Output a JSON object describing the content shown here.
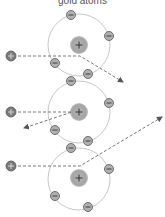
{
  "title": "gold atoms",
  "colors": {
    "orbit": "#c8c8c8",
    "nucleus": "#a9a9a9",
    "electron_fill": "#b0b0b0",
    "electron_stroke": "#6e6e6e",
    "alpha_fill": "#7a7a7a",
    "path": "#777777",
    "glyph": "#333333"
  },
  "atoms": [
    {
      "label": "gold atom 1",
      "nucleus_symbol": "+",
      "electron_symbol": "−"
    },
    {
      "label": "gold atom 2",
      "nucleus_symbol": "+",
      "electron_symbol": "−"
    },
    {
      "label": "gold atom 3",
      "nucleus_symbol": "+",
      "electron_symbol": "−"
    }
  ],
  "alpha_particles": [
    {
      "label": "alpha particle 1",
      "symbol": "+",
      "trajectory": "deflected down-right"
    },
    {
      "label": "alpha particle 2",
      "symbol": "+",
      "trajectory": "deflected back down-left"
    },
    {
      "label": "alpha particle 3",
      "symbol": "+",
      "trajectory": "deflected up-right"
    }
  ]
}
